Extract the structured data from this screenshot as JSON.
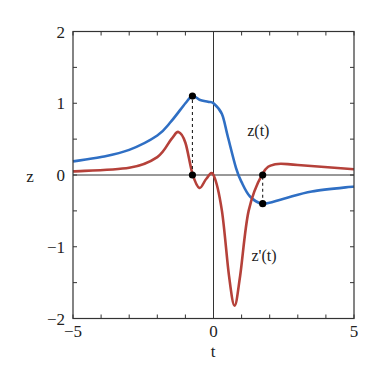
{
  "chart_data": {
    "type": "line",
    "title": "",
    "xlabel": "t",
    "ylabel": "z",
    "xlim": [
      -5,
      5
    ],
    "ylim": [
      -2,
      2
    ],
    "xticks": [
      -5,
      0,
      5
    ],
    "yticks": [
      -2,
      -1,
      0,
      1,
      2
    ],
    "x_minor_step": 1,
    "y_minor_step": 0.5,
    "grid": false,
    "zero_lines": true,
    "series": [
      {
        "name": "z(t)",
        "color": "#2f6fc4",
        "label_pos": [
          1.2,
          0.55
        ],
        "x": [
          -5,
          -4,
          -3,
          -2,
          -1.5,
          -1,
          -0.75,
          -0.5,
          -0.2,
          0,
          0.3,
          0.5,
          0.8,
          1.0,
          1.3,
          1.75,
          2.5,
          3.5,
          5
        ],
        "y": [
          0.19,
          0.25,
          0.35,
          0.55,
          0.75,
          1.0,
          1.1,
          1.05,
          1.02,
          1.0,
          0.85,
          0.55,
          0.1,
          -0.1,
          -0.3,
          -0.4,
          -0.33,
          -0.23,
          -0.16
        ]
      },
      {
        "name": "z'(t)",
        "color": "#b5413a",
        "label_pos": [
          1.35,
          -1.2
        ],
        "x": [
          -5,
          -3,
          -2,
          -1.5,
          -1.25,
          -1,
          -0.75,
          -0.5,
          -0.25,
          0,
          0.3,
          0.55,
          0.75,
          0.95,
          1.25,
          1.75,
          2.2,
          3,
          5
        ],
        "y": [
          0.05,
          0.1,
          0.25,
          0.5,
          0.6,
          0.45,
          0.02,
          -0.18,
          -0.05,
          0.0,
          -0.5,
          -1.4,
          -1.82,
          -1.4,
          -0.5,
          0.02,
          0.15,
          0.14,
          0.08
        ]
      }
    ],
    "markers": [
      {
        "x": -0.75,
        "y": 1.1
      },
      {
        "x": -0.75,
        "y": 0.0
      },
      {
        "x": 1.75,
        "y": 0.0
      },
      {
        "x": 1.75,
        "y": -0.4
      }
    ],
    "dashed_connectors": [
      {
        "x": -0.75,
        "y1": 0.0,
        "y2": 1.1
      },
      {
        "x": 1.75,
        "y1": -0.4,
        "y2": 0.0
      }
    ]
  }
}
